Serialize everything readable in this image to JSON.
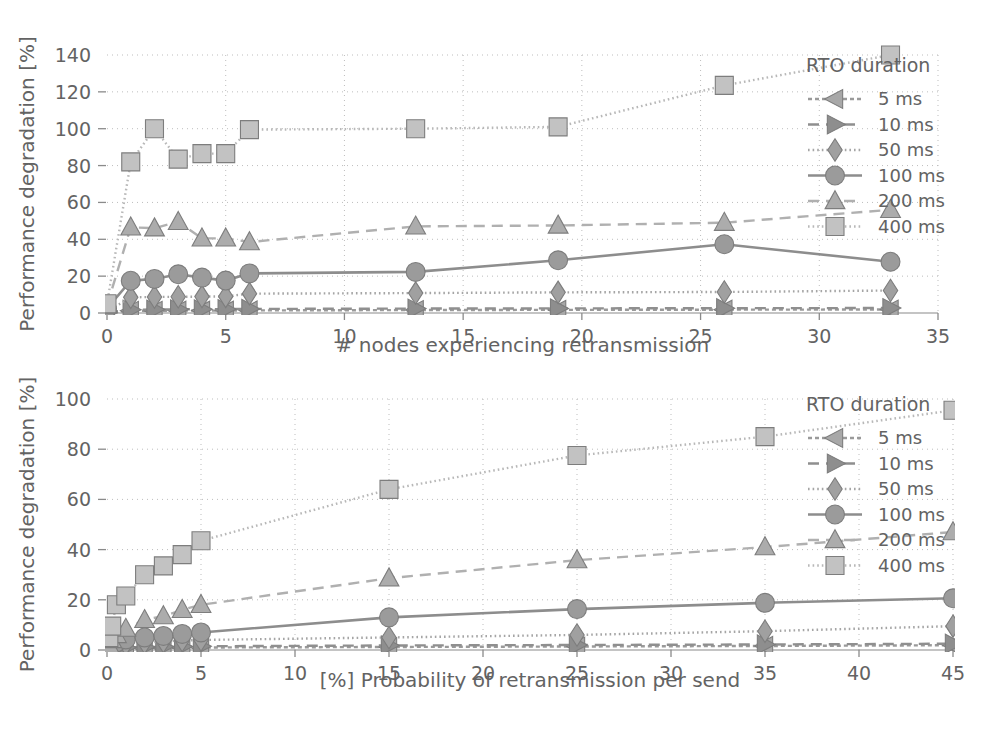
{
  "figure": {
    "background": "#ffffff",
    "text_color": "#636363",
    "grid_color": "#bdbdbd",
    "axis_color": "#8a8a8a"
  },
  "legend": {
    "title": "RTO duration",
    "entries": [
      {
        "label": "5 ms",
        "marker": "left-triangle",
        "dash": "4 3",
        "color": "#9a9a9a",
        "fill": "#a8a8a8"
      },
      {
        "label": "10 ms",
        "marker": "right-triangle",
        "dash": "11 7",
        "color": "#8f8f8f",
        "fill": "#8e8e8e"
      },
      {
        "label": "50 ms",
        "marker": "diamond",
        "dash": "1.6 3",
        "color": "#a5a5a5",
        "fill": "#a0a0a0"
      },
      {
        "label": "100 ms",
        "marker": "circle",
        "dash": "none",
        "color": "#8d8d8d",
        "fill": "#9b9b9b"
      },
      {
        "label": "200 ms",
        "marker": "up-triangle",
        "dash": "11 7",
        "color": "#b0b0b0",
        "fill": "#acacac"
      },
      {
        "label": "400 ms",
        "marker": "square",
        "dash": "1.6 3",
        "color": "#b8b8b8",
        "fill": "#c2c2c2"
      }
    ]
  },
  "chart_data": [
    {
      "id": "top",
      "type": "line",
      "title": "",
      "xlabel": "# nodes experiencing retransmission",
      "ylabel": "Performance degradation [%]",
      "xlim": [
        0,
        35
      ],
      "ylim": [
        0,
        140
      ],
      "xticks": [
        0,
        5,
        10,
        15,
        20,
        25,
        30,
        35
      ],
      "yticks": [
        0,
        20,
        40,
        60,
        80,
        100,
        120,
        140
      ],
      "grid": true,
      "legend_position": "top-right-outside",
      "series": [
        {
          "name": "5 ms",
          "x": [
            0,
            1,
            2,
            3,
            4,
            5,
            6,
            13,
            19,
            26,
            33
          ],
          "y": [
            0.3,
            1.2,
            1.2,
            1.3,
            1.3,
            1.3,
            1.4,
            1.6,
            1.7,
            1.8,
            1.9
          ]
        },
        {
          "name": "10 ms",
          "x": [
            0,
            1,
            2,
            3,
            4,
            5,
            6,
            13,
            19,
            26,
            33
          ],
          "y": [
            0.4,
            1.8,
            1.9,
            2.0,
            2.0,
            2.1,
            2.2,
            2.4,
            2.5,
            2.6,
            2.7
          ]
        },
        {
          "name": "50 ms",
          "x": [
            0,
            1,
            2,
            3,
            4,
            5,
            6,
            13,
            19,
            26,
            33
          ],
          "y": [
            0.8,
            8.5,
            8.7,
            8.8,
            8.9,
            9.0,
            10.5,
            10.8,
            11.2,
            11.4,
            12.2
          ]
        },
        {
          "name": "100 ms",
          "x": [
            0,
            1,
            2,
            3,
            4,
            5,
            6,
            13,
            19,
            26,
            33
          ],
          "y": [
            2.5,
            17.5,
            18.5,
            21.0,
            19.2,
            17.6,
            21.5,
            22.3,
            28.6,
            37.3,
            27.8
          ]
        },
        {
          "name": "200 ms",
          "x": [
            0,
            1,
            2,
            3,
            4,
            5,
            6,
            13,
            19,
            26,
            33
          ],
          "y": [
            4.0,
            46.5,
            46.0,
            49.5,
            40.5,
            40.5,
            38.5,
            47.0,
            47.5,
            49.0,
            56.0
          ]
        },
        {
          "name": "400 ms",
          "x": [
            0,
            1,
            2,
            3,
            4,
            5,
            6,
            13,
            19,
            26,
            33
          ],
          "y": [
            5.0,
            82.0,
            100.0,
            83.5,
            86.5,
            86.5,
            99.5,
            100.0,
            101.0,
            123.5,
            140.0
          ]
        }
      ]
    },
    {
      "id": "bottom",
      "type": "line",
      "title": "",
      "xlabel": "[%] Probability of retransmission per send",
      "ylabel": "Performance degradation [%]",
      "xlim": [
        0,
        45
      ],
      "ylim": [
        0,
        100
      ],
      "xticks": [
        0,
        5,
        10,
        15,
        20,
        25,
        30,
        35,
        40,
        45
      ],
      "yticks": [
        0,
        20,
        40,
        60,
        80,
        100
      ],
      "grid": true,
      "legend_position": "top-right-outside",
      "series": [
        {
          "name": "5 ms",
          "x": [
            0.1,
            0.25,
            0.5,
            1,
            2,
            3,
            4,
            5,
            15,
            25,
            35,
            45
          ],
          "y": [
            0.3,
            0.4,
            0.5,
            0.6,
            0.7,
            0.8,
            0.9,
            1.0,
            1.2,
            1.4,
            1.6,
            1.9
          ]
        },
        {
          "name": "10 ms",
          "x": [
            0.1,
            0.25,
            0.5,
            1,
            2,
            3,
            4,
            5,
            15,
            25,
            35,
            45
          ],
          "y": [
            0.4,
            0.6,
            0.8,
            1.0,
            1.2,
            1.3,
            1.4,
            1.5,
            1.8,
            2.0,
            2.2,
            2.5
          ]
        },
        {
          "name": "50 ms",
          "x": [
            0.1,
            0.25,
            0.5,
            1,
            2,
            3,
            4,
            5,
            15,
            25,
            35,
            45
          ],
          "y": [
            0.8,
            1.2,
            1.8,
            2.4,
            3.0,
            3.4,
            3.8,
            4.0,
            5.0,
            6.0,
            7.5,
            9.5
          ]
        },
        {
          "name": "100 ms",
          "x": [
            0.1,
            0.25,
            0.5,
            1,
            2,
            3,
            4,
            5,
            15,
            25,
            35,
            45
          ],
          "y": [
            1.2,
            2.0,
            3.0,
            4.2,
            5.0,
            5.6,
            6.4,
            7.0,
            13.0,
            16.3,
            18.8,
            20.6
          ]
        },
        {
          "name": "200 ms",
          "x": [
            0.1,
            0.25,
            0.5,
            1,
            2,
            3,
            4,
            5,
            15,
            25,
            35,
            45
          ],
          "y": [
            2.0,
            4.0,
            6.0,
            8.5,
            12.0,
            13.5,
            16.0,
            18.0,
            28.6,
            35.8,
            41.0,
            47.0
          ]
        },
        {
          "name": "400 ms",
          "x": [
            0.1,
            0.25,
            0.5,
            1,
            2,
            3,
            4,
            5,
            15,
            25,
            35,
            45
          ],
          "y": [
            5.0,
            9.5,
            18.0,
            21.5,
            30.0,
            33.5,
            38.0,
            43.5,
            64.0,
            77.5,
            85.0,
            95.5
          ]
        }
      ]
    }
  ]
}
